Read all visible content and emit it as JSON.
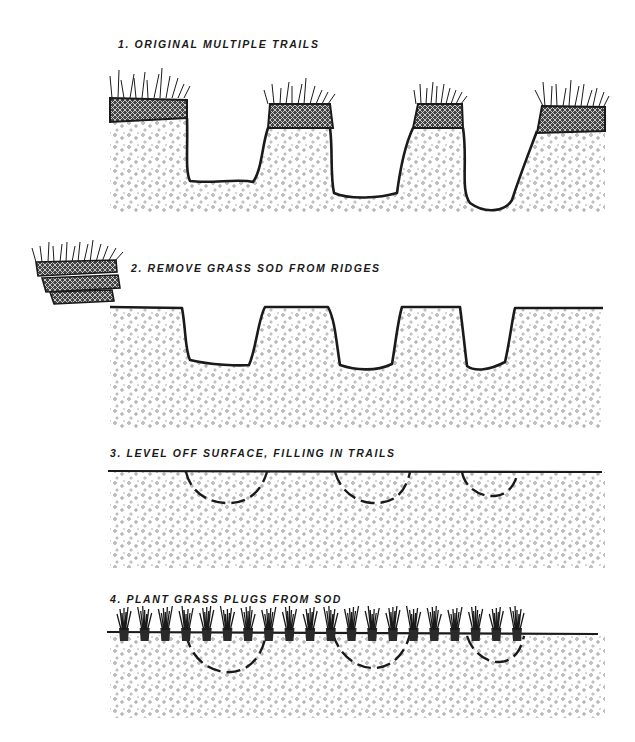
{
  "figure": {
    "colors": {
      "ink": "#1a1a1a",
      "soil_dot": "#8a8a8a",
      "background": "#ffffff"
    }
  },
  "steps": [
    {
      "number": 1,
      "label": "1. ORIGINAL MULTIPLE TRAILS",
      "x": 118,
      "y": 38,
      "description": "Four sod-capped ridges separated by three eroded trail channels"
    },
    {
      "number": 2,
      "label": "2. REMOVE GRASS SOD FROM RIDGES",
      "x": 131,
      "y": 262,
      "description": "Sod stacked aside; bare soil ridges with three trail channels"
    },
    {
      "number": 3,
      "label": "3. LEVEL OFF SURFACE, FILLING IN TRAILS",
      "x": 110,
      "y": 447,
      "description": "Level soil surface; dashed arcs mark three filled trails"
    },
    {
      "number": 4,
      "label": "4. PLANT GRASS PLUGS FROM SOD",
      "x": 110,
      "y": 593,
      "description": "Grass plugs planted along leveled surface over filled trails"
    }
  ],
  "panel4": {
    "plug_count": 20
  },
  "panel3": {
    "filled_trail_count": 3
  },
  "panel1": {
    "ridge_count": 4,
    "trail_count": 3
  }
}
